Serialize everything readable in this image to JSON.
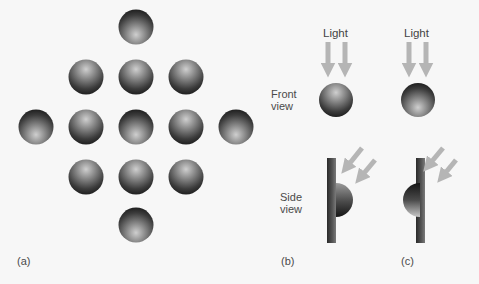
{
  "figure": {
    "panels": [
      {
        "id": "a",
        "label": "(a)",
        "description": "Diamond arrangement of 13 shaded spheres; lighting direction varies",
        "spheres": [
          {
            "cx": 136,
            "cy": 27,
            "lit_from": "bottom"
          },
          {
            "cx": 86,
            "cy": 77,
            "lit_from": "top"
          },
          {
            "cx": 136,
            "cy": 77,
            "lit_from": "top"
          },
          {
            "cx": 186,
            "cy": 77,
            "lit_from": "top"
          },
          {
            "cx": 36,
            "cy": 127,
            "lit_from": "bottom"
          },
          {
            "cx": 86,
            "cy": 127,
            "lit_from": "top"
          },
          {
            "cx": 136,
            "cy": 127,
            "lit_from": "bottom"
          },
          {
            "cx": 186,
            "cy": 127,
            "lit_from": "top"
          },
          {
            "cx": 236,
            "cy": 127,
            "lit_from": "bottom"
          },
          {
            "cx": 86,
            "cy": 177,
            "lit_from": "top"
          },
          {
            "cx": 136,
            "cy": 177,
            "lit_from": "top"
          },
          {
            "cx": 186,
            "cy": 177,
            "lit_from": "top"
          },
          {
            "cx": 136,
            "cy": 225,
            "lit_from": "bottom"
          }
        ]
      },
      {
        "id": "b",
        "label": "(b)",
        "light_label": "Light",
        "front_view_label": [
          "Front",
          "view"
        ],
        "side_view_label": [
          "Side",
          "view"
        ],
        "shape": "convex bump (lit from top)"
      },
      {
        "id": "c",
        "label": "(c)",
        "light_label": "Light",
        "shape": "concave dent (lit from bottom)"
      }
    ],
    "colors": {
      "background": "#f7f7f7",
      "sphere_dark": "#1e1e1e",
      "sphere_light": "#c8c8c8",
      "arrow": "#b5b5b5",
      "label": "#4a4a4a"
    }
  }
}
